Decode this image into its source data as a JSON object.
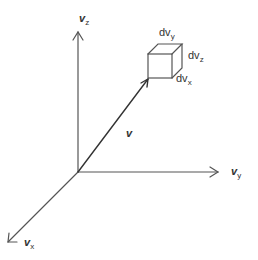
{
  "diagram": {
    "type": "3d-velocity-space",
    "axes": {
      "z": {
        "symbol": "v",
        "subscript": "z"
      },
      "y": {
        "symbol": "v",
        "subscript": "y"
      },
      "x": {
        "symbol": "v",
        "subscript": "x"
      }
    },
    "vector": {
      "symbol": "v"
    },
    "volume_element": {
      "top": {
        "prefix": "dv",
        "subscript": "y"
      },
      "right": {
        "prefix": "dv",
        "subscript": "z"
      },
      "bottom": {
        "prefix": "dv",
        "subscript": "x"
      }
    },
    "colors": {
      "line": "#555555",
      "text": "#333333",
      "background": "#ffffff"
    }
  }
}
